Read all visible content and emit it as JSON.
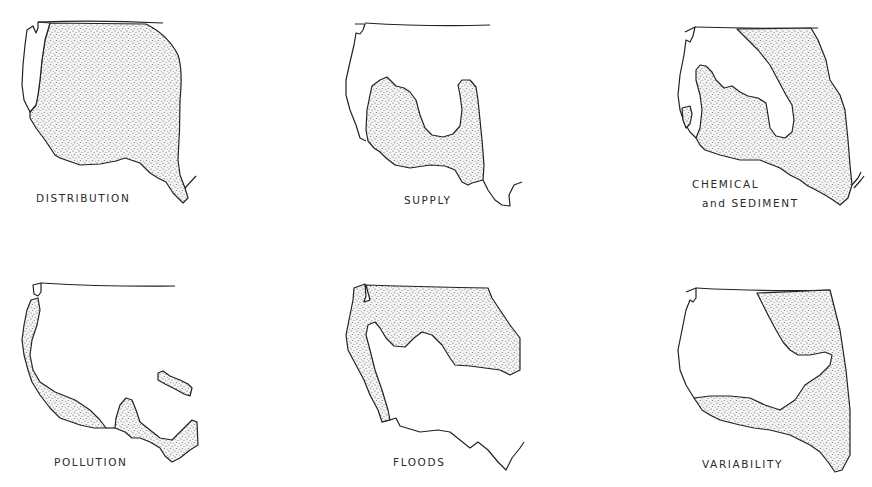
{
  "figure": {
    "type": "small-multiple maps of western United States",
    "stipple_color": "#555555",
    "line_color": "#222222",
    "background": "#ffffff",
    "panels": [
      {
        "id": "distribution",
        "label": "DISTRIBUTION"
      },
      {
        "id": "supply",
        "label": "SUPPLY"
      },
      {
        "id": "chemical-sediment",
        "label_line1": "CHEMICAL",
        "label_line2": "and  SEDIMENT"
      },
      {
        "id": "pollution",
        "label": "POLLUTION"
      },
      {
        "id": "floods",
        "label": "FLOODS"
      },
      {
        "id": "variability",
        "label": "VARIABILITY"
      }
    ]
  }
}
